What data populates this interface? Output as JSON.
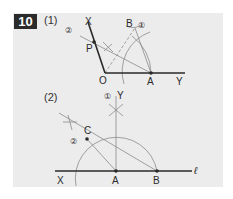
{
  "problem": {
    "number": "10",
    "badge_color": "#2b2b2b",
    "panel_color": "#ececec"
  },
  "part1": {
    "label": "(1)",
    "points": {
      "X": "X",
      "Y": "Y",
      "O": "O",
      "A": "A",
      "B": "B",
      "P": "P"
    },
    "step_marks": {
      "step1": "①",
      "step2": "②"
    }
  },
  "part2": {
    "label": "(2)",
    "points": {
      "X": "X",
      "Y": "Y",
      "A": "A",
      "B": "B",
      "C": "C",
      "line": "ℓ"
    },
    "step_marks": {
      "step1": "①",
      "step2": "②"
    }
  }
}
